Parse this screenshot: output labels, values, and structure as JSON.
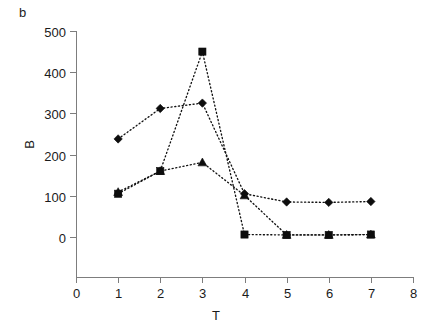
{
  "panel": {
    "label": "b"
  },
  "axes": {
    "y_title": "B",
    "x_title": "T",
    "y_ticks": [
      "0",
      "100",
      "200",
      "300",
      "400",
      "500"
    ],
    "x_ticks": [
      "0",
      "1",
      "2",
      "3",
      "4",
      "5",
      "6",
      "7",
      "8"
    ]
  },
  "chart_data": {
    "type": "line",
    "title": "b",
    "xlabel": "T",
    "ylabel": "B",
    "xlim": [
      0,
      8
    ],
    "ylim": [
      0,
      500
    ],
    "xticks": [
      0,
      1,
      2,
      3,
      4,
      5,
      6,
      7,
      8
    ],
    "yticks": [
      0,
      100,
      200,
      300,
      400,
      500
    ],
    "grid": false,
    "legend": "none",
    "linestyle": "dotted",
    "x": [
      1,
      2,
      3,
      4,
      5,
      6,
      7
    ],
    "series": [
      {
        "name": "series-diamond",
        "marker": "diamond",
        "color": "#0d0d0d",
        "values": [
          238,
          312,
          325,
          105,
          85,
          84,
          86
        ]
      },
      {
        "name": "series-square",
        "marker": "square",
        "color": "#0d0d0d",
        "values": [
          105,
          160,
          450,
          6,
          5,
          5,
          6
        ]
      },
      {
        "name": "series-triangle",
        "marker": "triangle",
        "color": "#0d0d0d",
        "values": [
          109,
          160,
          181,
          101,
          5,
          5,
          6
        ]
      }
    ]
  }
}
